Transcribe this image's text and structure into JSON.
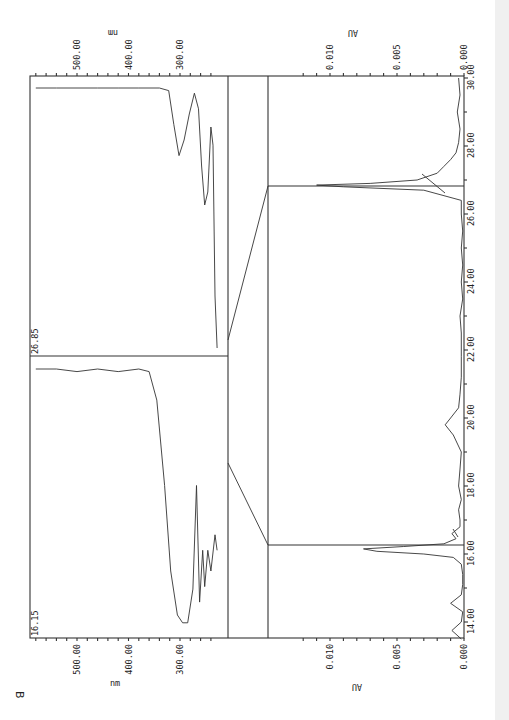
{
  "panel_label": "B",
  "chart_data": [
    {
      "type": "line",
      "title": "HPLC chromatogram (page rotated 90°)",
      "xlabel": "",
      "ylabel": "AU",
      "xlim": [
        13.5,
        30.0
      ],
      "ylim": [
        0.0,
        0.014
      ],
      "x_ticks": [
        "14.00",
        "16.00",
        "18.00",
        "20.00",
        "22.00",
        "24.00",
        "26.00",
        "28.00",
        "30.00"
      ],
      "y_ticks": [
        "0.000",
        "0.005",
        "0.010"
      ],
      "grid": false,
      "series": [
        {
          "name": "chromatogram",
          "x": [
            13.5,
            13.75,
            14.0,
            14.3,
            14.55,
            14.8,
            15.1,
            15.4,
            15.7,
            15.9,
            16.0,
            16.08,
            16.15,
            16.22,
            16.3,
            16.45,
            16.6,
            16.8,
            17.0,
            17.3,
            17.6,
            18.0,
            18.5,
            19.0,
            19.5,
            19.8,
            20.0,
            20.3,
            20.7,
            21.2,
            21.8,
            22.5,
            23.0,
            23.5,
            24.0,
            24.5,
            25.0,
            25.5,
            26.0,
            26.4,
            26.7,
            26.8,
            26.85,
            26.9,
            27.0,
            27.2,
            27.4,
            27.6,
            27.8,
            28.1,
            28.5,
            29.0,
            29.5,
            30.0
          ],
          "y": [
            0.0002,
            0.0009,
            0.0002,
            0.0001,
            0.001,
            0.0002,
            0.0001,
            0.0001,
            0.0002,
            0.0008,
            0.003,
            0.0065,
            0.0075,
            0.0045,
            0.0015,
            0.0006,
            0.0009,
            0.0003,
            0.0003,
            0.0004,
            0.0002,
            0.0004,
            0.0003,
            0.0002,
            0.0008,
            0.0014,
            0.001,
            0.0004,
            0.0003,
            0.0002,
            0.0002,
            0.0002,
            0.0003,
            0.0001,
            0.0002,
            0.0001,
            0.0002,
            0.0001,
            0.0002,
            0.0002,
            0.003,
            0.009,
            0.011,
            0.007,
            0.0035,
            0.002,
            0.0015,
            0.001,
            0.0006,
            0.0004,
            0.0003,
            0.0005,
            0.0003,
            0.0004
          ]
        }
      ],
      "annotations": [
        {
          "label": "16.15",
          "x": 16.15
        },
        {
          "label": "26.85",
          "x": 26.85
        }
      ]
    },
    {
      "type": "line",
      "title": "UV spectrum at 16.15 min",
      "xlabel": "nm",
      "ylabel": "",
      "xlim": [
        230,
        590
      ],
      "x_ticks": [
        "300.00",
        "400.00",
        "500.00"
      ],
      "series": [
        {
          "name": "16.15",
          "x": [
            228,
            232,
            240,
            246,
            252,
            256,
            262,
            268,
            275,
            285,
            295,
            305,
            318,
            330,
            345,
            360,
            380,
            420,
            460,
            500,
            540,
            580
          ],
          "y": [
            0.3,
            0.36,
            0.22,
            0.3,
            0.16,
            0.3,
            0.1,
            0.55,
            0.15,
            0.02,
            0.02,
            0.05,
            0.22,
            0.55,
            0.88,
            0.99,
            1.0,
            0.99,
            1.0,
            0.99,
            1.0,
            1.0
          ]
        }
      ]
    },
    {
      "type": "line",
      "title": "UV spectrum at 26.85 min",
      "xlabel": "nm",
      "ylabel": "",
      "xlim": [
        230,
        590
      ],
      "x_ticks": [
        "300.00",
        "400.00",
        "500.00"
      ],
      "series": [
        {
          "name": "26.85",
          "x": [
            228,
            232,
            236,
            240,
            246,
            252,
            258,
            264,
            272,
            282,
            292,
            302,
            312,
            322,
            340,
            380,
            420,
            460,
            500,
            540,
            580
          ],
          "y": [
            0.0,
            0.2,
            0.78,
            0.85,
            0.6,
            0.55,
            0.7,
            0.92,
            0.98,
            0.9,
            0.8,
            0.74,
            0.86,
            0.99,
            1.0,
            1.0,
            1.0,
            1.0,
            1.0,
            1.0,
            1.0
          ]
        }
      ]
    }
  ],
  "axes": {
    "au_unit": "AU",
    "nm_unit": "nm",
    "time_labels": [
      "14.00",
      "16.00",
      "18.00",
      "20.00",
      "22.00",
      "24.00",
      "26.00",
      "28.00",
      "30.00"
    ],
    "au_labels": [
      "0.000",
      "0.005",
      "0.010"
    ],
    "nm_labels": [
      "500.00",
      "400.00",
      "300.00"
    ],
    "spectrum_labels": [
      "16.15",
      "26.85"
    ]
  }
}
